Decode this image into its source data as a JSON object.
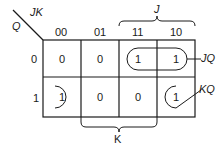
{
  "kmap": {
    "row_var": "Q",
    "col_var": "JK",
    "col_headers": [
      "00",
      "01",
      "11",
      "10"
    ],
    "row_headers": [
      "0",
      "1"
    ],
    "cells": [
      [
        "0",
        "0",
        "1",
        "1"
      ],
      [
        "1",
        "0",
        "0",
        "1"
      ]
    ],
    "group_labels": {
      "jq": "JQ",
      "kq": "KQ"
    },
    "brace_labels": {
      "j": "J",
      "k": "K"
    }
  }
}
